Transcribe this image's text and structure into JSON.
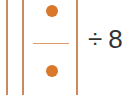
{
  "puzzle": {
    "fraction": {
      "numerator_dots": 1,
      "denominator_dots": 1
    },
    "operator": "÷",
    "operand": "8"
  },
  "colors": {
    "card_border": "#c98a60",
    "dot": "#d9782a",
    "fraction_line": "#e39a6a",
    "text": "#333333"
  }
}
